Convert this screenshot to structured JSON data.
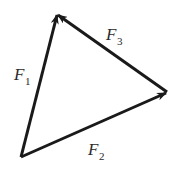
{
  "diagram": {
    "type": "force-vector-triangle",
    "stroke_color": "#1a1a1a",
    "vertices": {
      "top": [
        57,
        14
      ],
      "bottom_left": [
        21,
        157
      ],
      "right": [
        167,
        92
      ]
    },
    "vectors": [
      {
        "id": "F1",
        "symbol": "F",
        "subscript": "1",
        "from": "bottom_left",
        "to": "top"
      },
      {
        "id": "F2",
        "symbol": "F",
        "subscript": "2",
        "from": "bottom_left",
        "to": "right"
      },
      {
        "id": "F3",
        "symbol": "F",
        "subscript": "3",
        "from": "right",
        "to": "top"
      }
    ]
  }
}
